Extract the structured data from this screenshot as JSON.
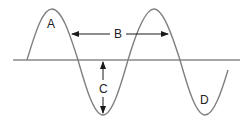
{
  "diagram": {
    "type": "wave-diagram",
    "colors": {
      "wave": "#808080",
      "axis": "#8a8a8a",
      "arrows": "#1a1a1a",
      "text": "#222222"
    },
    "labels": {
      "A": "A",
      "B": "B",
      "C": "C",
      "D": "D"
    },
    "label_meaning_positions": [
      {
        "label": "A",
        "position": "inside first crest"
      },
      {
        "label": "B",
        "position": "horizontal double arrow between crests (wavelength)"
      },
      {
        "label": "C",
        "position": "vertical double arrow from rest line to trough (amplitude)"
      },
      {
        "label": "D",
        "position": "inside second trough"
      }
    ]
  }
}
